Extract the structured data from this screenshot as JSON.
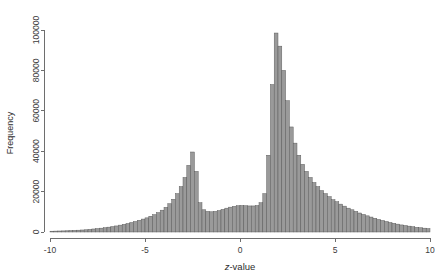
{
  "chart_data": {
    "type": "bar",
    "title": "",
    "subtitle": "",
    "xlabel": "z-value",
    "ylabel": "Frequency",
    "xlabel_italic_prefix": "z",
    "xlabel_rest": "-value",
    "xlim": [
      -10,
      10
    ],
    "ylim": [
      0,
      100000
    ],
    "grid": false,
    "legend": null,
    "bin_width": 0.2,
    "bar_fill_color": "#9a9a9a",
    "bar_edge_color": "#555555",
    "axis_color": "#6e6e6e",
    "xticks": [
      -10,
      -5,
      0,
      5,
      10
    ],
    "xtick_labels": [
      "-10",
      "-5",
      "0",
      "5",
      "10"
    ],
    "yticks": [
      0,
      20000,
      40000,
      60000,
      80000,
      100000
    ],
    "ytick_labels": [
      "0",
      "20000",
      "40000",
      "60000",
      "80000",
      "100000"
    ],
    "bin_centers": [
      -9.9,
      -9.7,
      -9.5,
      -9.3,
      -9.1,
      -8.9,
      -8.7,
      -8.5,
      -8.3,
      -8.1,
      -7.9,
      -7.7,
      -7.5,
      -7.3,
      -7.1,
      -6.9,
      -6.7,
      -6.5,
      -6.3,
      -6.1,
      -5.9,
      -5.7,
      -5.5,
      -5.3,
      -5.1,
      -4.9,
      -4.7,
      -4.5,
      -4.3,
      -4.1,
      -3.9,
      -3.7,
      -3.5,
      -3.3,
      -3.1,
      -2.9,
      -2.7,
      -2.5,
      -2.3,
      -2.1,
      -1.9,
      -1.7,
      -1.5,
      -1.3,
      -1.1,
      -0.9,
      -0.7,
      -0.5,
      -0.3,
      -0.1,
      0.1,
      0.3,
      0.5,
      0.7,
      0.9,
      1.1,
      1.3,
      1.5,
      1.7,
      1.9,
      2.1,
      2.3,
      2.5,
      2.7,
      2.9,
      3.1,
      3.3,
      3.5,
      3.7,
      3.9,
      4.1,
      4.3,
      4.5,
      4.7,
      4.9,
      5.1,
      5.3,
      5.5,
      5.7,
      5.9,
      6.1,
      6.3,
      6.5,
      6.7,
      6.9,
      7.1,
      7.3,
      7.5,
      7.7,
      7.9,
      8.1,
      8.3,
      8.5,
      8.7,
      8.9,
      9.1,
      9.3,
      9.5,
      9.7,
      9.9
    ],
    "values": [
      400,
      450,
      500,
      550,
      600,
      700,
      800,
      900,
      1000,
      1100,
      1300,
      1500,
      1700,
      1900,
      2100,
      2400,
      2700,
      3000,
      3400,
      3800,
      4200,
      4700,
      5200,
      5800,
      6400,
      7000,
      7800,
      8600,
      9600,
      10800,
      12200,
      14000,
      16200,
      19000,
      22500,
      27000,
      33000,
      39600,
      30000,
      14500,
      11000,
      10200,
      10000,
      10200,
      10600,
      11200,
      11800,
      12300,
      12700,
      13000,
      13100,
      13000,
      12900,
      12900,
      13100,
      14500,
      19000,
      38000,
      73000,
      98500,
      92000,
      80000,
      65000,
      52000,
      44000,
      38000,
      33500,
      30000,
      27000,
      24500,
      22500,
      20500,
      19000,
      17500,
      16000,
      15000,
      13800,
      12800,
      11800,
      11000,
      10200,
      9400,
      8700,
      8000,
      7400,
      6800,
      6200,
      5700,
      5200,
      4700,
      4300,
      3900,
      3500,
      3200,
      2900,
      2600,
      2300,
      2100,
      1900,
      1700
    ]
  },
  "axes": {
    "y_axis_title": "Frequency",
    "x_axis_title": "z-value"
  }
}
